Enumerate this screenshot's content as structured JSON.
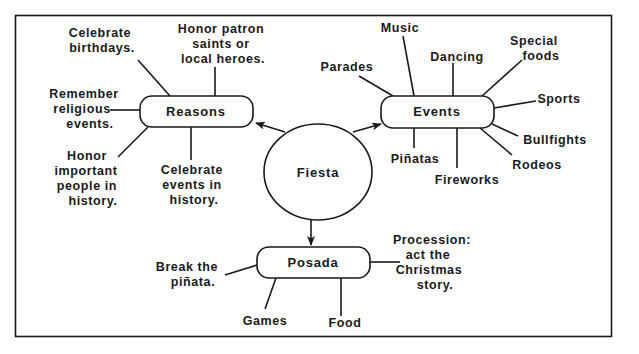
{
  "diagram": {
    "center": {
      "label": "Fiesta"
    },
    "nodes": {
      "reasons": {
        "label": "Reasons",
        "items": [
          [
            "Celebrate",
            "birthdays."
          ],
          [
            "Honor patron",
            "saints or",
            "local heroes."
          ],
          [
            "Remember",
            "religious",
            "events."
          ],
          [
            "Honor",
            "important",
            "people in",
            "history."
          ],
          [
            "Celebrate",
            "events in",
            "history."
          ]
        ]
      },
      "events": {
        "label": "Events",
        "items": [
          "Music",
          "Dancing",
          "Parades",
          [
            "Special",
            "foods"
          ],
          "Sports",
          "Bullfights",
          "Rodeos",
          "Piñatas",
          "Fireworks"
        ]
      },
      "posada": {
        "label": "Posada",
        "items": [
          [
            "Break the",
            "piñata."
          ],
          "Games",
          "Food",
          [
            "Procession:",
            "act the",
            "Christmas",
            "story."
          ]
        ]
      }
    },
    "colors": {
      "ink": "#1a1a1a",
      "background": "#ffffff"
    }
  }
}
